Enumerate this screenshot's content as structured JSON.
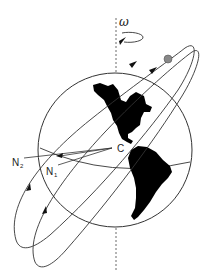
{
  "diagram": {
    "labels": {
      "omega": "ω",
      "center": "C",
      "n1": "N",
      "n1_sub": "1",
      "n2": "N",
      "n2_sub": "2"
    },
    "colors": {
      "line": "#333333",
      "land": "#000000",
      "satellite": "#888888",
      "background": "#ffffff"
    }
  }
}
